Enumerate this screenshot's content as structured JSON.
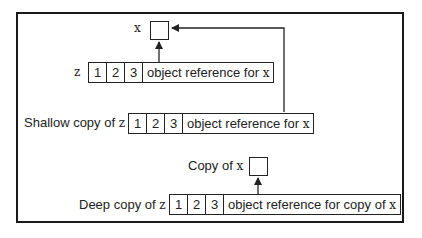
{
  "diagram": {
    "title": "",
    "nodes": {
      "x_object": {
        "label": "x"
      },
      "z_list": {
        "label": "z",
        "cells": [
          "1",
          "2",
          "3"
        ],
        "reference_label_prefix": "object reference for ",
        "reference_var": "x"
      },
      "shallow_copy": {
        "label_prefix": "Shallow copy of ",
        "label_var": "z",
        "cells": [
          "1",
          "2",
          "3"
        ],
        "reference_label_prefix": "object reference for ",
        "reference_var": "x"
      },
      "copy_of_x": {
        "label_prefix": "Copy of ",
        "label_var": "x"
      },
      "deep_copy": {
        "label_prefix": "Deep copy of ",
        "label_var": "z",
        "cells": [
          "1",
          "2",
          "3"
        ],
        "reference_label_prefix": "object reference for copy of ",
        "reference_var": "x"
      }
    },
    "edges": [
      {
        "from": "z_list.reference",
        "to": "x_object"
      },
      {
        "from": "shallow_copy.reference",
        "to": "x_object"
      },
      {
        "from": "deep_copy.reference",
        "to": "copy_of_x"
      }
    ]
  }
}
